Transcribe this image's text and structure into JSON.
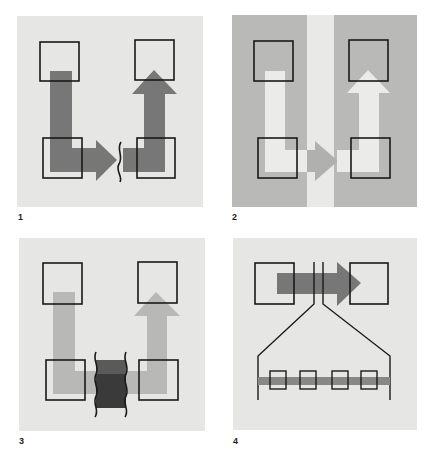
{
  "figure": {
    "panels": [
      {
        "id": "1",
        "label": "1",
        "description": "Data moved from top-left to top-right via bottom boxes across a break"
      },
      {
        "id": "2",
        "label": "2",
        "description": "Light path crossing a light vertical channel between two grey regions"
      },
      {
        "id": "3",
        "label": "3",
        "description": "Light path interrupted by a dark wavy-edged block"
      },
      {
        "id": "4",
        "label": "4",
        "description": "Arrow between two boxes expanded into a row of four small boxes"
      }
    ]
  },
  "colors": {
    "panel_bg": "#e6e6e4",
    "panel2_bg": "#b9b9b7",
    "panel2_stripe": "#e9e9e7",
    "dark_arrow": "#777777",
    "mid_arrow": "#b0b0ae",
    "light_arrow": "#ebebe9",
    "dark_block": "#3a3a3a",
    "box_stroke": "#1a1a1a"
  }
}
